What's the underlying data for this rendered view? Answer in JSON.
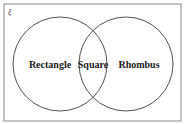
{
  "diagram": {
    "type": "venn",
    "universal_set_symbol": "ξ",
    "sets": [
      {
        "name": "Rectangle"
      },
      {
        "name": "Rhombus"
      }
    ],
    "intersection": {
      "name": "Square"
    },
    "colors": {
      "stroke": "#555555",
      "frame": "#888888",
      "text": "#222222"
    }
  }
}
